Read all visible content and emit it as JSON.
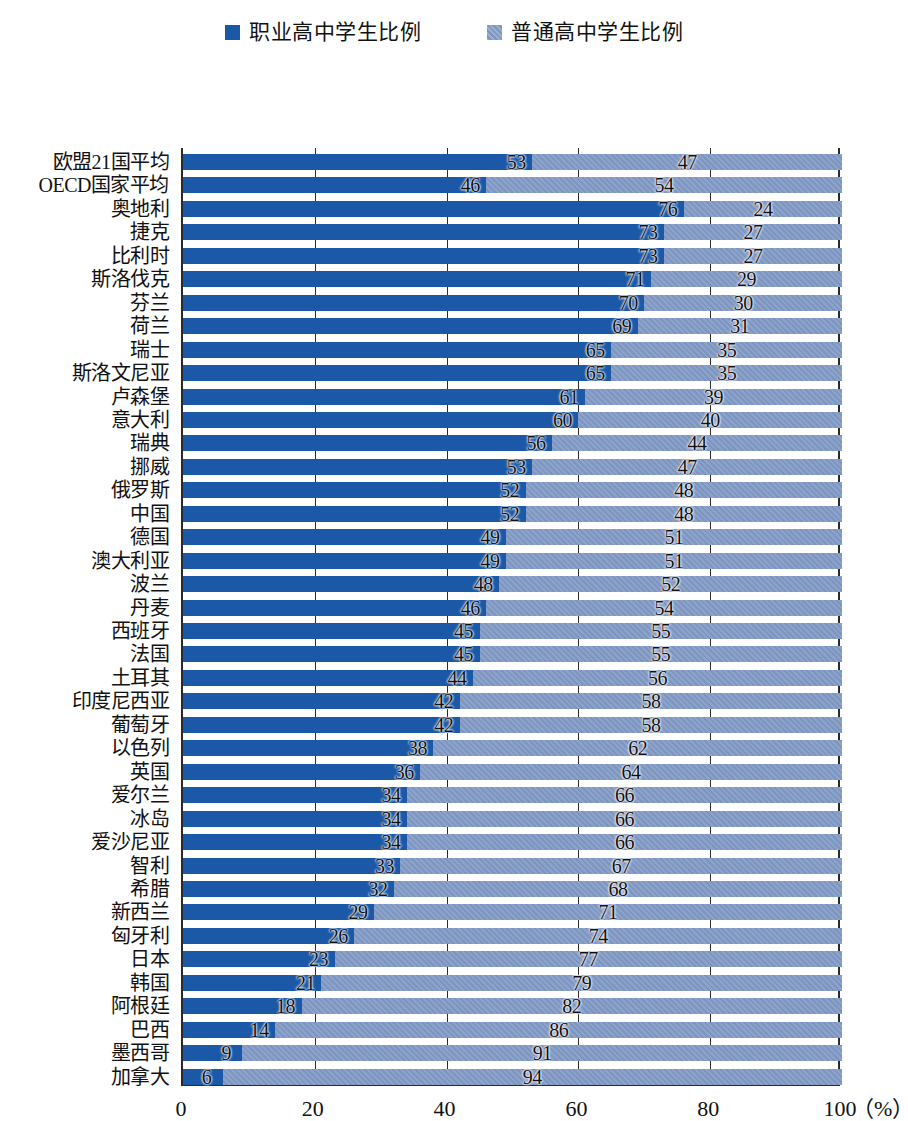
{
  "legend": {
    "entries": [
      {
        "label": "职业高中学生比例",
        "color": "#1b59a8",
        "icon": "square-swatch"
      },
      {
        "label": "普通高中学生比例",
        "color": "#7d95c1",
        "icon": "square-swatch"
      }
    ]
  },
  "axis": {
    "ticks": [
      "0",
      "20",
      "40",
      "60",
      "80",
      "100"
    ],
    "unit": "（%）"
  },
  "chart_data": {
    "type": "bar",
    "orientation": "horizontal",
    "stacked": true,
    "percent": true,
    "title": "",
    "xlabel": "（%）",
    "ylabel": "",
    "xlim": [
      0,
      100
    ],
    "xticks": [
      0,
      20,
      40,
      60,
      80,
      100
    ],
    "grid": "vertical",
    "legend_position": "top-center",
    "categories": [
      "欧盟21国平均",
      "OECD国家平均",
      "奥地利",
      "捷克",
      "比利时",
      "斯洛伐克",
      "芬兰",
      "荷兰",
      "瑞士",
      "斯洛文尼亚",
      "卢森堡",
      "意大利",
      "瑞典",
      "挪威",
      "俄罗斯",
      "中国",
      "德国",
      "澳大利亚",
      "波兰",
      "丹麦",
      "西班牙",
      "法国",
      "土耳其",
      "印度尼西亚",
      "葡萄牙",
      "以色列",
      "英国",
      "爱尔兰",
      "冰岛",
      "爱沙尼亚",
      "智利",
      "希腊",
      "新西兰",
      "匈牙利",
      "日本",
      "韩国",
      "阿根廷",
      "巴西",
      "墨西哥",
      "加拿大"
    ],
    "series": [
      {
        "name": "职业高中学生比例",
        "color": "#1b59a8",
        "values": [
          53,
          46,
          76,
          73,
          73,
          71,
          70,
          69,
          65,
          65,
          61,
          60,
          56,
          53,
          52,
          52,
          49,
          49,
          48,
          46,
          45,
          45,
          44,
          42,
          42,
          38,
          36,
          34,
          34,
          34,
          33,
          32,
          29,
          26,
          23,
          21,
          18,
          14,
          9,
          6
        ]
      },
      {
        "name": "普通高中学生比例",
        "color": "#7d95c1",
        "values": [
          47,
          54,
          24,
          27,
          27,
          29,
          30,
          31,
          35,
          35,
          39,
          40,
          44,
          47,
          48,
          48,
          51,
          51,
          52,
          54,
          55,
          55,
          56,
          58,
          58,
          62,
          64,
          66,
          66,
          66,
          67,
          68,
          71,
          74,
          77,
          79,
          82,
          86,
          91,
          94
        ]
      }
    ]
  }
}
